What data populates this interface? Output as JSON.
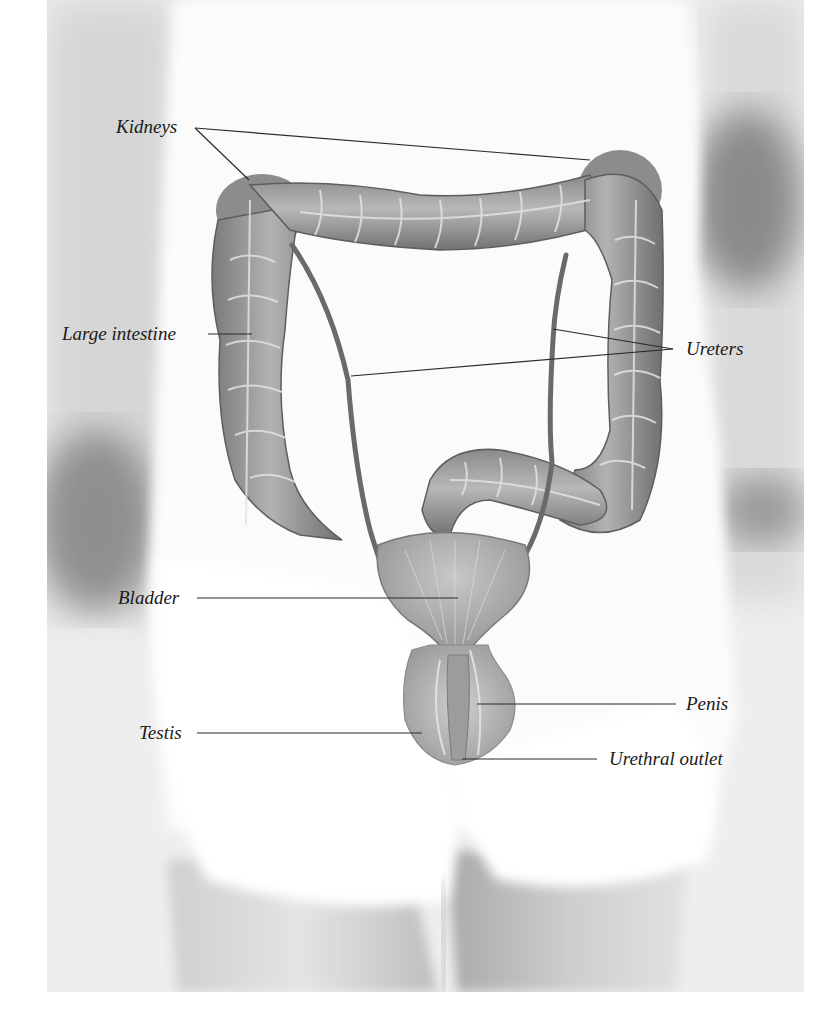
{
  "figure": {
    "type": "anatomical illustration",
    "labels": {
      "kidneys": "Kidneys",
      "large_intestine": "Large intestine",
      "ureters": "Ureters",
      "bladder": "Bladder",
      "penis": "Penis",
      "testis": "Testis",
      "urethral_outlet": "Urethral outlet"
    },
    "colors": {
      "background": "#ffffff",
      "photo_light": "#f2f2f2",
      "photo_shadow": "#8a8a8a",
      "organ_fill": "#9a9a9a",
      "organ_dark": "#6b6b6b",
      "organ_highlight": "#d8d8d8",
      "leader_line": "#2a2a2a",
      "label_text": "#1a1a1a"
    }
  }
}
